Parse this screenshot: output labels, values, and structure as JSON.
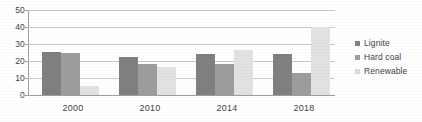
{
  "chart_data": {
    "type": "bar",
    "title": "",
    "subtitle": "",
    "xlabel": "",
    "ylabel": "",
    "categories": [
      "2000",
      "2010",
      "2014",
      "2018"
    ],
    "series": [
      {
        "name": "Lignite",
        "color": "#808080",
        "values": [
          25.5,
          22.5,
          24.0,
          24.0
        ]
      },
      {
        "name": "Hard coal",
        "color": "#9d9d9d",
        "values": [
          24.5,
          18.0,
          18.5,
          13.0
        ]
      },
      {
        "name": "Renewable",
        "color": "#e2e2e2",
        "values": [
          5.5,
          16.5,
          26.5,
          40.0
        ]
      }
    ],
    "ylim": [
      0,
      50
    ],
    "yticks": [
      0,
      10,
      20,
      30,
      40,
      50
    ],
    "ytick_labels": [
      "0",
      "10",
      "20",
      "30",
      "40",
      "50"
    ],
    "grid": true,
    "legend_position": "right",
    "annotations": []
  },
  "legend": {
    "items": [
      {
        "label": "Lignite"
      },
      {
        "label": "Hard coal"
      },
      {
        "label": "Renewable"
      }
    ]
  },
  "axis": {
    "y_labels": [
      "50",
      "40",
      "30",
      "20",
      "10",
      "0"
    ],
    "x_labels": [
      "2000",
      "2010",
      "2014",
      "2018"
    ]
  }
}
